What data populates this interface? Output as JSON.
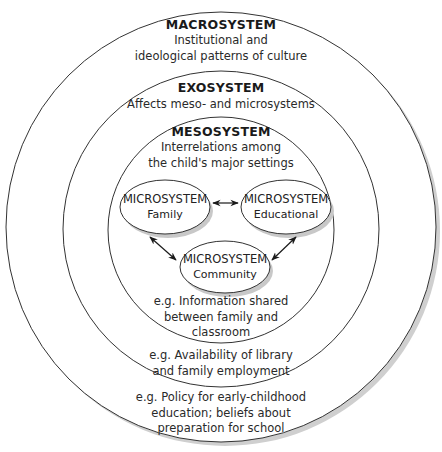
{
  "diagram": {
    "type": "nested-circles",
    "levels": [
      {
        "id": "macrosystem",
        "title": "MACROSYSTEM",
        "description": [
          "Institutional and",
          "ideological patterns of culture"
        ],
        "example": [
          "e.g. Policy for early-childhood",
          "education; beliefs about",
          "preparation for school"
        ]
      },
      {
        "id": "exosystem",
        "title": "EXOSYSTEM",
        "description": [
          "Affects meso- and microsystems"
        ],
        "example": [
          "e.g. Availability of library",
          "and family employment"
        ]
      },
      {
        "id": "mesosystem",
        "title": "MESOSYSTEM",
        "description": [
          "Interrelations among",
          "the child's major settings"
        ],
        "example": [
          "e.g. Information shared",
          "between family and",
          "classroom"
        ]
      }
    ],
    "microsystems": [
      {
        "id": "family",
        "title": "MICROSYSTEM",
        "subtitle": "Family"
      },
      {
        "id": "educational",
        "title": "MICROSYSTEM",
        "subtitle": "Educational"
      },
      {
        "id": "community",
        "title": "MICROSYSTEM",
        "subtitle": "Community"
      }
    ],
    "connections": [
      {
        "from": "family",
        "to": "educational",
        "type": "bidirectional"
      },
      {
        "from": "family",
        "to": "community",
        "type": "bidirectional"
      },
      {
        "from": "educational",
        "to": "community",
        "type": "bidirectional"
      }
    ],
    "colors": {
      "stroke": "#333333",
      "shadow": "#c8c8c8",
      "background": "#ffffff"
    }
  }
}
